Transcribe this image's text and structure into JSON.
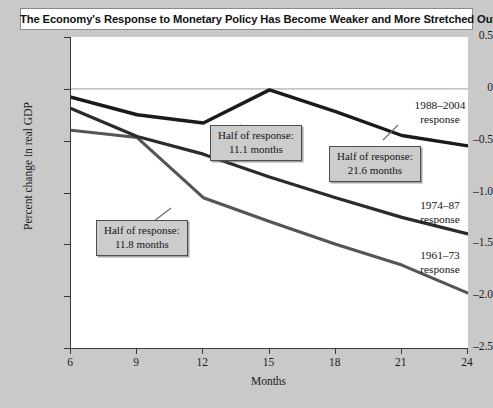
{
  "chart_data": {
    "type": "line",
    "title": "The Economy's Response to Monetary Policy Has Become Weaker and More Stretched Out",
    "xlabel": "Months",
    "ylabel": "Percent change in real GDP",
    "xlim": [
      6,
      24
    ],
    "ylim": [
      -2.5,
      0.5
    ],
    "xticks": [
      "6",
      "9",
      "12",
      "15",
      "18",
      "21",
      "24"
    ],
    "yticks": [
      "0.5",
      "0",
      "-0.5",
      "-1.0",
      "-1.5",
      "-2.0",
      "-2.5"
    ],
    "grid": false,
    "legend_position": "inline-right-labels",
    "zero_line": true,
    "x": [
      6,
      9,
      12,
      15,
      18,
      21,
      24
    ],
    "series": [
      {
        "name": "1988-2004 response",
        "label": "1988–2004",
        "label_line2": "response",
        "color": "#1a1a1a",
        "values": [
          -0.08,
          -0.25,
          -0.33,
          -0.01,
          -0.22,
          -0.45,
          -0.55
        ]
      },
      {
        "name": "1974-87 response",
        "label": "1974–87",
        "label_line2": "response",
        "color": "#2b2b2b",
        "values": [
          -0.19,
          -0.46,
          -0.63,
          -0.85,
          -1.05,
          -1.24,
          -1.4
        ]
      },
      {
        "name": "1961-73 response",
        "label": "1961–73",
        "label_line2": "response",
        "color": "#555555",
        "values": [
          -0.4,
          -0.47,
          -1.05,
          -1.28,
          -1.5,
          -1.7,
          -1.97
        ]
      }
    ],
    "annotations": [
      {
        "id": "half-response-11-1",
        "line1": "Half of response:",
        "line2": "11.1  months",
        "value_months": 11.1,
        "series": "1988-2004 response"
      },
      {
        "id": "half-response-21-6",
        "line1": "Half of response:",
        "line2": "21.6 months",
        "value_months": 21.6,
        "series": "1974-87 response"
      },
      {
        "id": "half-response-11-8",
        "line1": "Half of response:",
        "line2": "11.8 months",
        "value_months": 11.8,
        "series": "1961-73 response"
      }
    ]
  }
}
